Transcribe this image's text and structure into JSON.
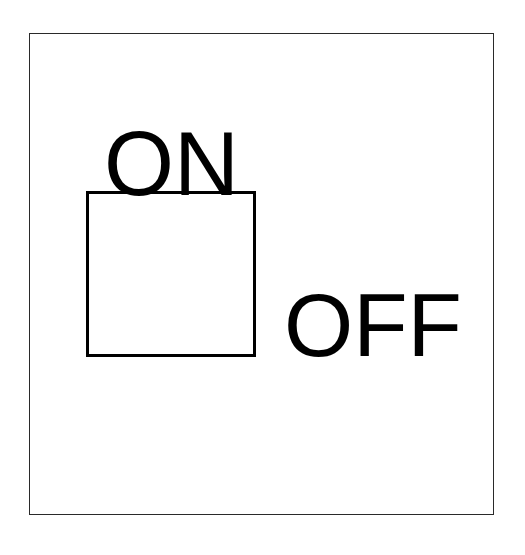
{
  "diagram": {
    "labels": {
      "on": "ON",
      "off": "OFF"
    },
    "colors": {
      "stroke": "#000000",
      "frame": "#2a2a2a",
      "background": "#ffffff"
    }
  }
}
